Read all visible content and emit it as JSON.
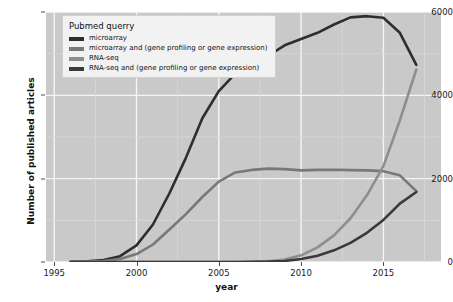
{
  "chart_data": {
    "type": "line",
    "title": "",
    "xlabel": "year",
    "ylabel": "Number of published articles",
    "xlim": [
      1994.5,
      2018.5
    ],
    "ylim": [
      0,
      6000
    ],
    "grid": true,
    "legend_position": "top-left",
    "legend_title": "Pubmed querry",
    "xticks": [
      1995,
      2000,
      2005,
      2010,
      2015
    ],
    "yticks": [
      0,
      2000,
      4000,
      6000
    ],
    "x": [
      1996,
      1997,
      1998,
      1999,
      2000,
      2001,
      2002,
      2003,
      2004,
      2005,
      2006,
      2007,
      2008,
      2009,
      2010,
      2011,
      2012,
      2013,
      2014,
      2015,
      2016,
      2017
    ],
    "series": [
      {
        "name": "microarray",
        "color": "#2e2e2e",
        "values": [
          5,
          15,
          50,
          140,
          400,
          900,
          1650,
          2500,
          3450,
          4100,
          4520,
          4700,
          4950,
          5200,
          5350,
          5500,
          5700,
          5870,
          5900,
          5860,
          5500,
          4730
        ]
      },
      {
        "name": "microarray and (gene profiling or gene expression)",
        "color": "#787878",
        "values": [
          2,
          8,
          25,
          70,
          190,
          420,
          780,
          1150,
          1560,
          1930,
          2150,
          2210,
          2240,
          2230,
          2200,
          2210,
          2215,
          2205,
          2200,
          2180,
          2080,
          1700
        ]
      },
      {
        "name": "RNA-seq",
        "color": "#8e8e8e",
        "values": [
          0,
          0,
          0,
          0,
          0,
          0,
          0,
          0,
          0,
          0,
          0,
          5,
          20,
          60,
          160,
          350,
          640,
          1050,
          1600,
          2300,
          3400,
          4620
        ]
      },
      {
        "name": "RNA-seq and (gene profiling or gene expression)",
        "color": "#3a3a3a",
        "values": [
          0,
          0,
          0,
          0,
          0,
          0,
          0,
          0,
          0,
          0,
          0,
          2,
          8,
          25,
          70,
          150,
          280,
          460,
          700,
          1010,
          1400,
          1680
        ]
      }
    ]
  },
  "axes": {
    "y_tick_labels": [
      "0",
      "2000",
      "4000",
      "6000"
    ],
    "x_tick_labels": [
      "1995",
      "2000",
      "2005",
      "2010",
      "2015"
    ]
  },
  "style": {
    "panel_background": "#c9c9c9",
    "gridline_color": "#f5f5f5",
    "figure_background": "#ffffff"
  }
}
